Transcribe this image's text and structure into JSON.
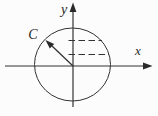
{
  "figure": {
    "type": "math-diagram",
    "description_visible_elements": "circle centered at axes origin, vector from origin to upper-left rim, two horizontal dashed projection lines right of y-axis",
    "colors": {
      "background": "#fcfcfc",
      "line": "#333333",
      "arrowhead": "#2a2a2a",
      "text": "#1f1f1f"
    },
    "labels": {
      "vector_label": "C",
      "x_axis_label": "x",
      "y_axis_label": "y"
    }
  }
}
